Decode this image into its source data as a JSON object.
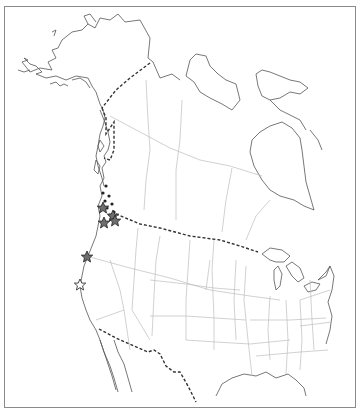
{
  "map": {
    "region": "Western North America",
    "style": "black-and-white outline map",
    "colors": {
      "coastline": "#555555",
      "state_province_borders": "#bdbdbd",
      "international_border": "#333333",
      "filled_star": "#6e6e6e",
      "dot": "#222222"
    },
    "legend": [],
    "markers": {
      "dots": [
        {
          "x": 106,
          "y": 186
        },
        {
          "x": 103,
          "y": 193
        },
        {
          "x": 109,
          "y": 196
        },
        {
          "x": 105,
          "y": 201
        },
        {
          "x": 112,
          "y": 204
        },
        {
          "x": 107,
          "y": 208
        },
        {
          "x": 114,
          "y": 212
        },
        {
          "x": 110,
          "y": 215
        }
      ],
      "filled_stars": [
        {
          "x": 103,
          "y": 208
        },
        {
          "x": 113,
          "y": 216
        },
        {
          "x": 104,
          "y": 223
        },
        {
          "x": 115,
          "y": 221
        },
        {
          "x": 87,
          "y": 257
        }
      ],
      "open_stars": [
        {
          "x": 80,
          "y": 285
        }
      ]
    }
  }
}
